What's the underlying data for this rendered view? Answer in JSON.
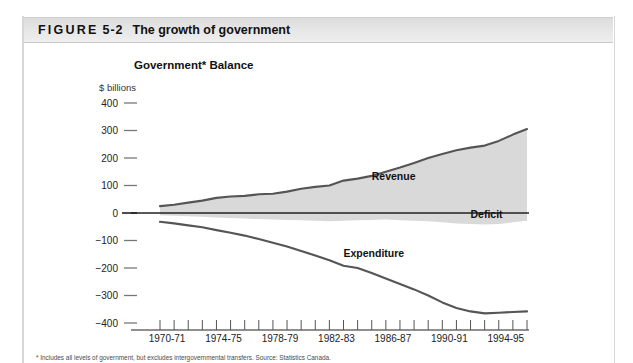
{
  "figure": {
    "label_word": "FIGURE",
    "number": "5-2",
    "title": "The growth of government"
  },
  "chart_title": "Government* Balance",
  "units_label": "$ billions",
  "footnote": "* Includes all levels of government, but excludes intergovernmental transfers. Source: Statistics Canada.",
  "colors": {
    "header_bar": "#e4e4e4",
    "area_fill": "#d9d9d9",
    "line": "#555555",
    "axis": "#222222",
    "page_bg": "#ffffff"
  },
  "chart_data": {
    "type": "area",
    "title": "Government* Balance",
    "xlabel": "",
    "ylabel": "$ billions",
    "ylim": [
      -400,
      400
    ],
    "ytick_labels": [
      "400",
      "300",
      "200",
      "100",
      "0",
      "−100",
      "−200",
      "−300",
      "−400"
    ],
    "ytick_values": [
      400,
      300,
      200,
      100,
      0,
      -100,
      -200,
      -300,
      -400
    ],
    "xtick_labels": [
      "1970-71",
      "1974-75",
      "1978-79",
      "1982-83",
      "1986-87",
      "1990-91",
      "1994-95"
    ],
    "x_start_year": 1970,
    "x_end_year": 1996,
    "grid": false,
    "legend": "inline-annotations",
    "annotations": [
      {
        "text": "Revenue",
        "x_year": 1985,
        "y_value": 120
      },
      {
        "text": "Deficit",
        "x_year": 1992,
        "y_value": -18
      },
      {
        "text": "Expenditure",
        "x_year": 1983,
        "y_value": -160
      }
    ],
    "x": [
      1970,
      1971,
      1972,
      1973,
      1974,
      1975,
      1976,
      1977,
      1978,
      1979,
      1980,
      1981,
      1982,
      1983,
      1984,
      1985,
      1986,
      1987,
      1988,
      1989,
      1990,
      1991,
      1992,
      1993,
      1994,
      1995,
      1996
    ],
    "series": [
      {
        "name": "Revenue",
        "values": [
          25,
          30,
          38,
          45,
          55,
          60,
          62,
          68,
          70,
          78,
          88,
          95,
          100,
          118,
          125,
          135,
          150,
          165,
          182,
          200,
          215,
          228,
          238,
          245,
          262,
          285,
          305
        ]
      },
      {
        "name": "Expenditure",
        "values": [
          -32,
          -38,
          -45,
          -52,
          -62,
          -72,
          -82,
          -95,
          -108,
          -122,
          -138,
          -155,
          -172,
          -192,
          -200,
          -218,
          -238,
          -258,
          -278,
          -300,
          -325,
          -345,
          -358,
          -365,
          -363,
          -360,
          -358
        ]
      },
      {
        "name": "Deficit",
        "values": [
          -8,
          -10,
          -12,
          -14,
          -16,
          -18,
          -20,
          -22,
          -24,
          -25,
          -26,
          -28,
          -30,
          -28,
          -26,
          -25,
          -24,
          -26,
          -28,
          -30,
          -34,
          -38,
          -40,
          -42,
          -40,
          -34,
          -28
        ]
      }
    ]
  }
}
